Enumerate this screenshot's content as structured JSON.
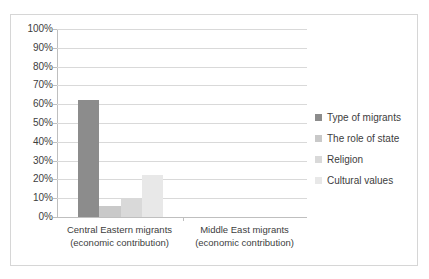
{
  "chart_data": {
    "type": "bar",
    "title": "",
    "subtitle": "",
    "xlabel": "",
    "ylabel": "",
    "ylim": [
      0,
      100
    ],
    "ytick_labels": [
      "100%",
      "90%",
      "80%",
      "70%",
      "60%",
      "50%",
      "40%",
      "30%",
      "20%",
      "10%",
      "0%"
    ],
    "ytick_values": [
      100,
      90,
      80,
      70,
      60,
      50,
      40,
      30,
      20,
      10,
      0
    ],
    "grid": "horizontal",
    "legend_position": "right",
    "categories": [
      {
        "line1": "Central Eastern migrants",
        "line2": "(economic contribution)"
      },
      {
        "line1": "Middle East migrants",
        "line2": "(economic contribution)"
      }
    ],
    "series": [
      {
        "name": "Type of migrants",
        "color": "#8c8c8c",
        "values": [
          62,
          0
        ]
      },
      {
        "name": "The role of state",
        "color": "#c9c9c9",
        "values": [
          6,
          0
        ]
      },
      {
        "name": "Religion",
        "color": "#d9d9d9",
        "values": [
          9.5,
          0
        ]
      },
      {
        "name": "Cultural values",
        "color": "#e8e8e8",
        "values": [
          22.5,
          0
        ]
      }
    ]
  },
  "style": {
    "frame_color": "#d6d6d6",
    "gridline_color": "#d9d9d9",
    "axis_color": "#bfbfbf",
    "text_color": "#3d3d3d",
    "background": "#ffffff"
  }
}
